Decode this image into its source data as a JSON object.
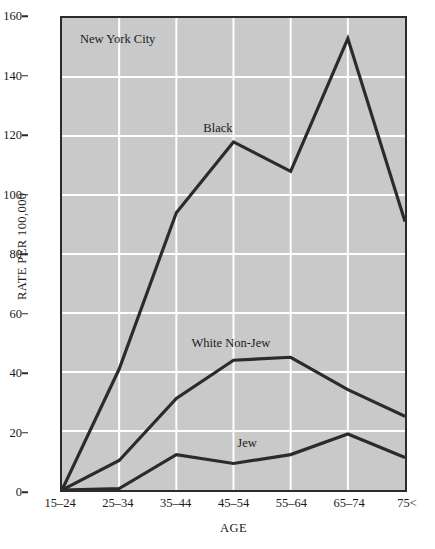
{
  "chart_data": {
    "type": "line",
    "title": "New York City",
    "xlabel": "AGE",
    "ylabel": "RATE PER 100,000",
    "categories": [
      "15–24",
      "25–34",
      "35–44",
      "45–54",
      "55–64",
      "65–74",
      "75<"
    ],
    "ylim": [
      0,
      160
    ],
    "yticks": [
      0,
      20,
      40,
      60,
      80,
      100,
      120,
      140,
      160
    ],
    "grid": "white horizontal and vertical gridlines on gray panel",
    "legend": "inline series labels placed next to each curve",
    "series": [
      {
        "name": "Black",
        "values": [
          0,
          41,
          94,
          118,
          108,
          153,
          91
        ],
        "color": "#2b2b2b",
        "label_text": "Black"
      },
      {
        "name": "White Non-Jew",
        "values": [
          0,
          10,
          31,
          44,
          45,
          34,
          25
        ],
        "color": "#2b2b2b",
        "label_text": "White Non-Jew"
      },
      {
        "name": "Jew",
        "values": [
          0,
          0.5,
          12,
          9,
          12,
          19,
          11
        ],
        "color": "#2b2b2b",
        "label_text": "Jew"
      }
    ],
    "panel_color": "#c9c9c9",
    "gridline_color": "#ffffff",
    "axis_color": "#2b2b2b"
  },
  "annotations": {
    "city_note": "New York City"
  }
}
